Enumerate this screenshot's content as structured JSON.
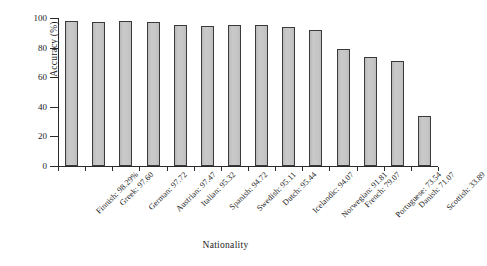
{
  "chart_data": {
    "type": "bar",
    "title": "",
    "xlabel": "Nationality",
    "ylabel": "Accuracy (%)",
    "ylim": [
      0,
      100
    ],
    "yticks": [
      0,
      20,
      40,
      60,
      80,
      100
    ],
    "ytick_labels": [
      "0",
      "20",
      "40",
      "60",
      "80",
      "100"
    ],
    "grid": false,
    "legend": "none",
    "categories": [
      "Finnish: 98.29%",
      "Greek: 97.60",
      "German: 97.72",
      "Austrian: 97.47",
      "Italian: 95.32",
      "Spanish: 94.72",
      "Swedish: 95.11",
      "Dutch: 95.44",
      "Icelandic: 94.07",
      "Norwegian: 91.81",
      "French: 79.07",
      "Portuguese: 73.54",
      "Danish: 71.07",
      "Scottish: 33.89"
    ],
    "values": [
      98.29,
      97.6,
      97.72,
      97.47,
      95.32,
      94.72,
      95.11,
      95.44,
      94.07,
      91.81,
      79.07,
      73.54,
      71.07,
      33.89
    ],
    "bar_fill_color": "#c4c4c4",
    "bar_edge_color": "#3a3a3a",
    "background_color": "#ffffff"
  }
}
